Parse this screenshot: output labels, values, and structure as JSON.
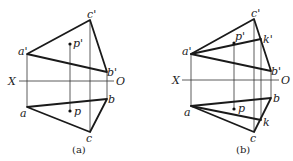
{
  "figure": {
    "panels": [
      {
        "caption": "(a)",
        "axis": {
          "left_label": "X",
          "right_label": "O"
        },
        "labels": {
          "c_prime": "c'",
          "a_prime": "a'",
          "b_prime": "b'",
          "p_prime": "p'",
          "a": "a",
          "b": "b",
          "c": "c",
          "p": "p"
        }
      },
      {
        "caption": "(b)",
        "axis": {
          "left_label": "X",
          "right_label": "O"
        },
        "labels": {
          "c_prime": "c'",
          "a_prime": "a'",
          "b_prime": "b'",
          "p_prime": "p'",
          "k_prime": "k'",
          "a": "a",
          "b": "b",
          "c": "c",
          "p": "p",
          "k": "k"
        }
      }
    ]
  }
}
